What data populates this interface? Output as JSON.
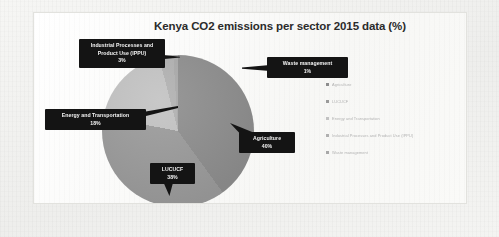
{
  "chart_data": {
    "type": "pie",
    "title": "Kenya CO2 emissions per sector 2015 data (%)",
    "unit": "%",
    "categories": [
      "Agriculture",
      "LUCUCF",
      "Energy and Transportation",
      "Industrial Processes and Product Use (IPPU)",
      "Waste management"
    ],
    "values": [
      40,
      38,
      18,
      3,
      1
    ],
    "labels": [
      "Agriculture\n40%",
      "LUCUCF\n38%",
      "Energy and Transportation\n18%",
      "Industrial Processes and Product Use (IPPU)\n3%",
      "Waste management\n1%"
    ],
    "colors": [
      "#8d8d8d",
      "#9a9a9a",
      "#c2c2c2",
      "#b0b0b0",
      "#a8a8a8"
    ],
    "legend_position": "right",
    "grid": false,
    "start_angle_deg": 0,
    "xlabel": "",
    "ylabel": ""
  },
  "title": {
    "text": "Kenya CO2 emissions per sector 2015 data (%)"
  },
  "callouts": {
    "ippu": {
      "line1": "Industrial Processes and",
      "line2": "Product Use (IPPU)",
      "percent": "3%"
    },
    "energy": {
      "line1": "Energy and Transportation",
      "percent": "18%"
    },
    "waste": {
      "line1": "Waste management",
      "percent": "1%"
    },
    "agriculture": {
      "line1": "Agriculture",
      "percent": "40%"
    },
    "lucucf": {
      "line1": "LUCUCF",
      "percent": "38%"
    }
  },
  "legend": {
    "items": [
      {
        "label": "Agriculture",
        "color": "#8d8d8d"
      },
      {
        "label": "LUCUCF",
        "color": "#9a9a9a"
      },
      {
        "label": "Energy and Transportation",
        "color": "#c2c2c2"
      },
      {
        "label": "Industrial Processes and Product Use (IPPU)",
        "color": "#b0b0b0"
      },
      {
        "label": "Waste management",
        "color": "#a8a8a8"
      }
    ]
  }
}
